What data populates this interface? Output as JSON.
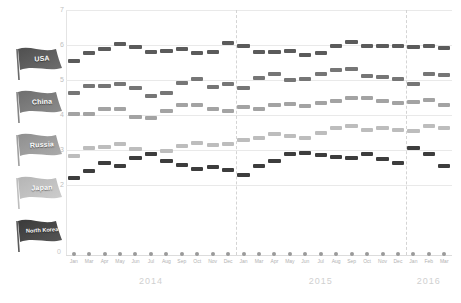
{
  "chart_data": {
    "type": "line",
    "title": "",
    "xlabel": "",
    "ylabel": "",
    "ylim": [
      0,
      7
    ],
    "yticks": [
      0,
      2,
      3,
      4,
      5,
      6,
      7
    ],
    "grid": true,
    "legend_position": "left",
    "year_labels": [
      "2014",
      "2015",
      "2016"
    ],
    "month_labels": [
      "Jan",
      "Mar",
      "Apr",
      "May",
      "Jun",
      "Jul",
      "Aug",
      "Sep",
      "Oct",
      "Nov",
      "Dec"
    ],
    "x": [
      "2014-Jan",
      "2014-Mar",
      "2014-Apr",
      "2014-May",
      "2014-Jun",
      "2014-Jul",
      "2014-Aug",
      "2014-Sep",
      "2014-Oct",
      "2014-Nov",
      "2014-Dec",
      "2015-Jan",
      "2015-Mar",
      "2015-Apr",
      "2015-May",
      "2015-Jun",
      "2015-Jul",
      "2015-Aug",
      "2015-Sep",
      "2015-Oct",
      "2015-Nov",
      "2015-Dec",
      "2016-Jan",
      "2016-Feb",
      "2016-Mar"
    ],
    "series": [
      {
        "name": "USA",
        "color": "#5b5b5b",
        "values": [
          5.55,
          5.78,
          5.9,
          6.02,
          5.95,
          5.8,
          5.82,
          5.88,
          5.78,
          5.8,
          6.05,
          5.98,
          5.8,
          5.8,
          5.82,
          5.72,
          5.78,
          5.98,
          6.1,
          5.98,
          5.98,
          5.98,
          5.95,
          5.98,
          5.92
        ]
      },
      {
        "name": "China",
        "color": "#767676",
        "values": [
          4.62,
          4.82,
          4.82,
          4.9,
          4.78,
          4.55,
          4.62,
          4.92,
          5.02,
          4.8,
          4.88,
          4.78,
          5.05,
          5.18,
          5.0,
          5.02,
          5.18,
          5.3,
          5.32,
          5.12,
          5.1,
          5.02,
          4.88,
          5.18,
          5.15
        ]
      },
      {
        "name": "Russia",
        "color": "#a3a3a3",
        "values": [
          4.02,
          4.02,
          4.18,
          4.18,
          3.95,
          3.92,
          4.12,
          4.28,
          4.3,
          4.18,
          4.12,
          4.22,
          4.18,
          4.3,
          4.32,
          4.25,
          4.35,
          4.4,
          4.48,
          4.48,
          4.4,
          4.35,
          4.38,
          4.42,
          4.3
        ]
      },
      {
        "name": "Japan",
        "color": "#bdbdbd",
        "values": [
          2.82,
          3.05,
          3.1,
          3.18,
          3.02,
          2.88,
          2.98,
          3.12,
          3.2,
          3.15,
          3.18,
          3.3,
          3.35,
          3.45,
          3.4,
          3.35,
          3.5,
          3.62,
          3.7,
          3.58,
          3.62,
          3.58,
          3.55,
          3.7,
          3.62
        ]
      },
      {
        "name": "North Korea",
        "color": "#3d3d3d",
        "values": [
          2.2,
          2.4,
          2.62,
          2.55,
          2.78,
          2.88,
          2.7,
          2.58,
          2.45,
          2.52,
          2.42,
          2.3,
          2.55,
          2.7,
          2.88,
          2.92,
          2.85,
          2.8,
          2.78,
          2.88,
          2.75,
          2.62,
          3.05,
          2.88,
          2.55
        ]
      }
    ]
  },
  "legend": {
    "items": [
      {
        "label": "USA",
        "flag_color_a": "#4f4f4f",
        "flag_color_b": "#6e6e6e"
      },
      {
        "label": "China",
        "flag_color_a": "#6e6e6e",
        "flag_color_b": "#8c8c8c"
      },
      {
        "label": "Russia",
        "flag_color_a": "#8f8f8f",
        "flag_color_b": "#ababab"
      },
      {
        "label": "Japan",
        "flag_color_a": "#b5b5b5",
        "flag_color_b": "#cdcdcd"
      },
      {
        "label": "North Korea",
        "flag_color_a": "#3a3a3a",
        "flag_color_b": "#565656"
      }
    ]
  },
  "axis": {
    "zero_label": "0"
  }
}
